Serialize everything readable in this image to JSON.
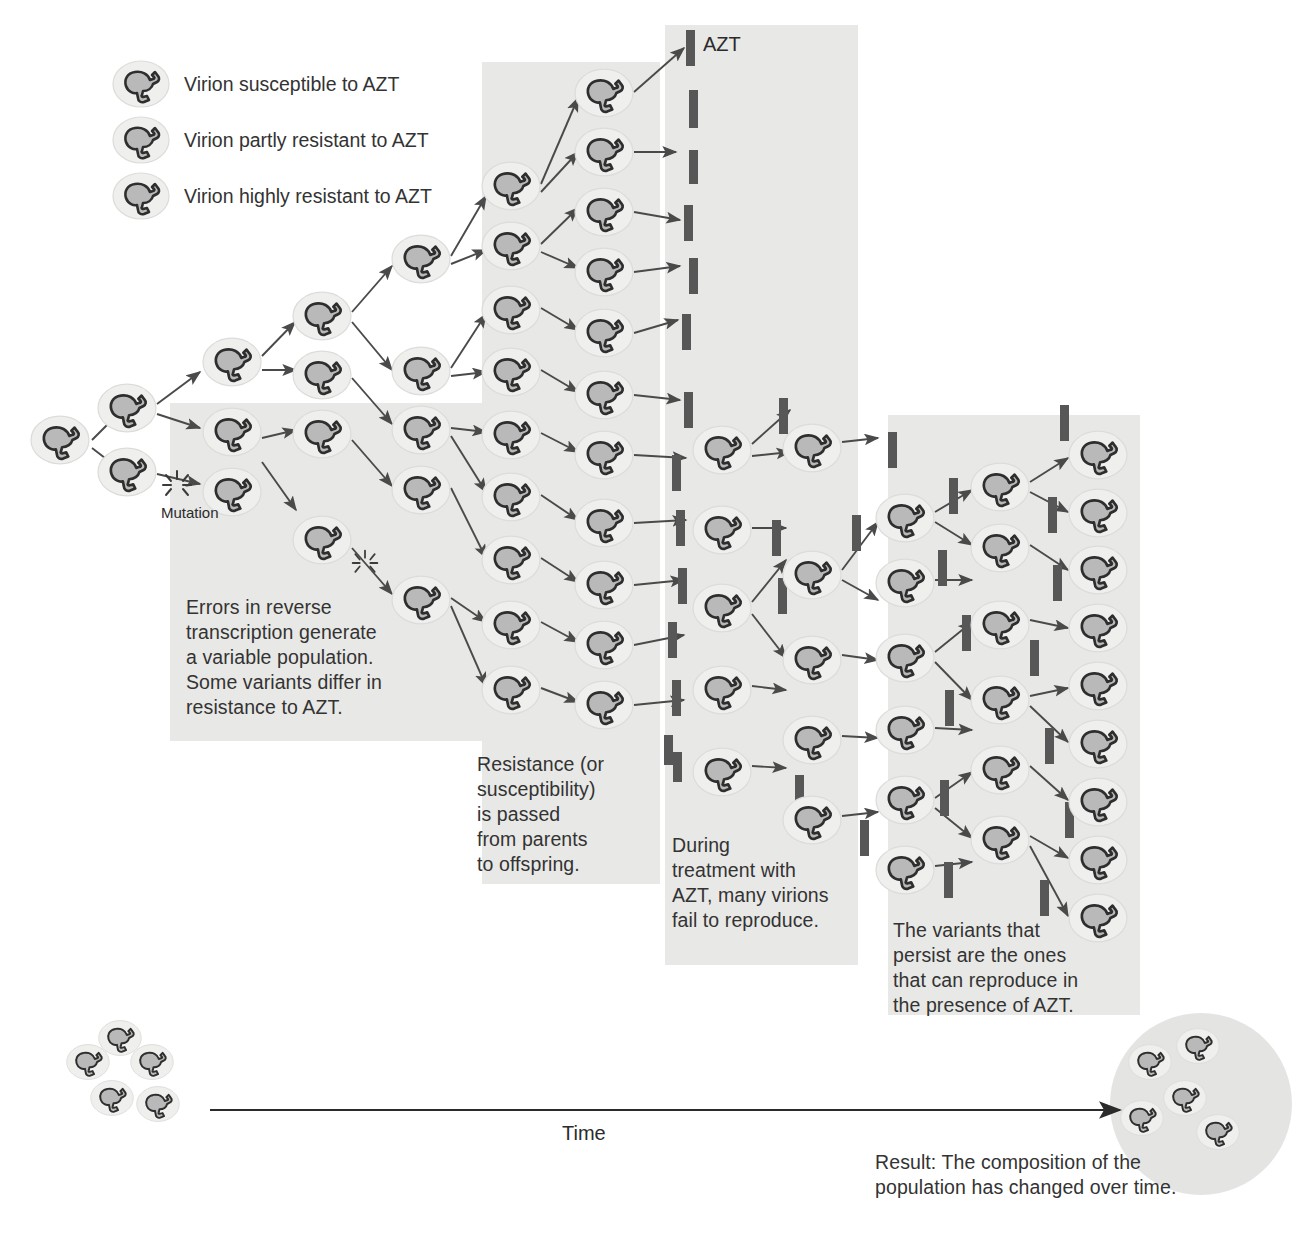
{
  "figure": {
    "type": "diagram"
  },
  "legend": {
    "items": [
      {
        "icon": "virion-icon",
        "label": "Virion susceptible to AZT",
        "fill": "#b3b3b3"
      },
      {
        "icon": "virion-icon",
        "label": "Virion partly resistant to AZT",
        "fill": "#bdbdbd"
      },
      {
        "icon": "virion-icon",
        "label": "Virion highly resistant to AZT",
        "fill": "#c7c7c7"
      }
    ]
  },
  "labels": {
    "mutation": "Mutation",
    "azt": "AZT",
    "time": "Time"
  },
  "captions": [
    {
      "id": "caption-variation",
      "text": "Errors in reverse\ntranscription generate\na variable population.\nSome variants differ in\nresistance to AZT."
    },
    {
      "id": "caption-heredity",
      "text": "Resistance (or\nsusceptibility)\nis passed\nfrom parents\nto offspring."
    },
    {
      "id": "caption-selection",
      "text": "During\ntreatment with\nAZT, many virions\nfail to reproduce."
    },
    {
      "id": "caption-persistence",
      "text": "The variants that\npersist are the ones\nthat can reproduce in\nthe presence of AZT."
    }
  ],
  "result": {
    "text": "Result: The composition of the\npopulation has changed over time."
  },
  "colors": {
    "panel_shade": "#e8e8e6",
    "virion_body": "#b9b9b9",
    "virion_outline": "#2e2e2e",
    "virion_halo": "#efefed",
    "azt_bar": "#575757",
    "arrow": "#4a4a4a",
    "text": "#333333",
    "end_circle": "#e4e4e2"
  },
  "chart_data": {
    "type": "diagram",
    "stages": [
      {
        "name": "origin",
        "virion_count": 1
      },
      {
        "name": "first-division",
        "virion_count": 2
      },
      {
        "name": "variation-panel",
        "virion_count": 8
      },
      {
        "name": "heredity-panel",
        "virion_count": 14
      },
      {
        "name": "selection-panel",
        "virion_count": 10
      },
      {
        "name": "persistence-panel",
        "virion_count": 18
      }
    ],
    "azt_bar_count": 40,
    "start_population": 5,
    "end_population": 5
  },
  "virions": [
    {
      "x": 60,
      "y": 440,
      "r": 30
    },
    {
      "x": 127,
      "y": 408,
      "r": 30
    },
    {
      "x": 127,
      "y": 472,
      "r": 30
    },
    {
      "x": 232,
      "y": 362,
      "r": 30
    },
    {
      "x": 232,
      "y": 432,
      "r": 30
    },
    {
      "x": 232,
      "y": 492,
      "r": 30
    },
    {
      "x": 322,
      "y": 316,
      "r": 30
    },
    {
      "x": 322,
      "y": 375,
      "r": 30
    },
    {
      "x": 322,
      "y": 434,
      "r": 30
    },
    {
      "x": 322,
      "y": 540,
      "r": 30
    },
    {
      "x": 421,
      "y": 259,
      "r": 30
    },
    {
      "x": 421,
      "y": 371,
      "r": 30
    },
    {
      "x": 421,
      "y": 430,
      "r": 30
    },
    {
      "x": 421,
      "y": 490,
      "r": 30
    },
    {
      "x": 421,
      "y": 600,
      "r": 30
    },
    {
      "x": 511,
      "y": 186,
      "r": 30
    },
    {
      "x": 511,
      "y": 246,
      "r": 30
    },
    {
      "x": 511,
      "y": 310,
      "r": 30
    },
    {
      "x": 511,
      "y": 372,
      "r": 30
    },
    {
      "x": 511,
      "y": 435,
      "r": 30
    },
    {
      "x": 511,
      "y": 497,
      "r": 30
    },
    {
      "x": 511,
      "y": 560,
      "r": 30
    },
    {
      "x": 511,
      "y": 625,
      "r": 30
    },
    {
      "x": 511,
      "y": 690,
      "r": 30
    },
    {
      "x": 604,
      "y": 93,
      "r": 30
    },
    {
      "x": 604,
      "y": 152,
      "r": 30
    },
    {
      "x": 604,
      "y": 212,
      "r": 30
    },
    {
      "x": 604,
      "y": 272,
      "r": 30
    },
    {
      "x": 604,
      "y": 333,
      "r": 30
    },
    {
      "x": 604,
      "y": 395,
      "r": 30
    },
    {
      "x": 604,
      "y": 455,
      "r": 30
    },
    {
      "x": 604,
      "y": 523,
      "r": 30
    },
    {
      "x": 604,
      "y": 585,
      "r": 30
    },
    {
      "x": 604,
      "y": 645,
      "r": 30
    },
    {
      "x": 604,
      "y": 705,
      "r": 30
    },
    {
      "x": 722,
      "y": 450,
      "r": 30
    },
    {
      "x": 722,
      "y": 530,
      "r": 30
    },
    {
      "x": 722,
      "y": 608,
      "r": 30
    },
    {
      "x": 722,
      "y": 690,
      "r": 30
    },
    {
      "x": 722,
      "y": 772,
      "r": 30
    },
    {
      "x": 812,
      "y": 448,
      "r": 30
    },
    {
      "x": 812,
      "y": 575,
      "r": 30
    },
    {
      "x": 812,
      "y": 660,
      "r": 30
    },
    {
      "x": 812,
      "y": 740,
      "r": 30
    },
    {
      "x": 812,
      "y": 820,
      "r": 30
    },
    {
      "x": 905,
      "y": 518,
      "r": 30
    },
    {
      "x": 905,
      "y": 583,
      "r": 30
    },
    {
      "x": 905,
      "y": 658,
      "r": 30
    },
    {
      "x": 905,
      "y": 730,
      "r": 30
    },
    {
      "x": 905,
      "y": 800,
      "r": 30
    },
    {
      "x": 905,
      "y": 870,
      "r": 30
    },
    {
      "x": 1000,
      "y": 487,
      "r": 30
    },
    {
      "x": 1000,
      "y": 548,
      "r": 30
    },
    {
      "x": 1000,
      "y": 625,
      "r": 30
    },
    {
      "x": 1000,
      "y": 700,
      "r": 30
    },
    {
      "x": 1000,
      "y": 770,
      "r": 30
    },
    {
      "x": 1000,
      "y": 840,
      "r": 30
    },
    {
      "x": 1098,
      "y": 455,
      "r": 30
    },
    {
      "x": 1098,
      "y": 513,
      "r": 30
    },
    {
      "x": 1098,
      "y": 570,
      "r": 30
    },
    {
      "x": 1098,
      "y": 628,
      "r": 30
    },
    {
      "x": 1098,
      "y": 686,
      "r": 30
    },
    {
      "x": 1098,
      "y": 744,
      "r": 30
    },
    {
      "x": 1098,
      "y": 802,
      "r": 30
    },
    {
      "x": 1098,
      "y": 860,
      "r": 30
    },
    {
      "x": 1098,
      "y": 918,
      "r": 30
    }
  ],
  "start_cluster": [
    {
      "x": 88,
      "y": 1062,
      "r": 22
    },
    {
      "x": 120,
      "y": 1038,
      "r": 22
    },
    {
      "x": 152,
      "y": 1062,
      "r": 22
    },
    {
      "x": 112,
      "y": 1098,
      "r": 22
    },
    {
      "x": 158,
      "y": 1104,
      "r": 22
    }
  ],
  "end_cluster": [
    {
      "x": 1150,
      "y": 1062,
      "r": 22
    },
    {
      "x": 1198,
      "y": 1046,
      "r": 22
    },
    {
      "x": 1185,
      "y": 1098,
      "r": 22
    },
    {
      "x": 1142,
      "y": 1118,
      "r": 22
    },
    {
      "x": 1218,
      "y": 1132,
      "r": 22
    }
  ],
  "azt_bars": [
    {
      "x": 686,
      "y": 30,
      "w": 9,
      "h": 36
    },
    {
      "x": 689,
      "y": 90,
      "w": 9,
      "h": 38
    },
    {
      "x": 689,
      "y": 150,
      "w": 9,
      "h": 34
    },
    {
      "x": 684,
      "y": 205,
      "w": 9,
      "h": 36
    },
    {
      "x": 689,
      "y": 258,
      "w": 9,
      "h": 36
    },
    {
      "x": 682,
      "y": 314,
      "w": 9,
      "h": 36
    },
    {
      "x": 684,
      "y": 392,
      "w": 9,
      "h": 36
    },
    {
      "x": 672,
      "y": 455,
      "w": 9,
      "h": 36
    },
    {
      "x": 676,
      "y": 510,
      "w": 9,
      "h": 36
    },
    {
      "x": 678,
      "y": 568,
      "w": 9,
      "h": 36
    },
    {
      "x": 668,
      "y": 622,
      "w": 9,
      "h": 36
    },
    {
      "x": 672,
      "y": 680,
      "w": 9,
      "h": 36
    },
    {
      "x": 664,
      "y": 735,
      "w": 9,
      "h": 30
    },
    {
      "x": 673,
      "y": 752,
      "w": 9,
      "h": 30
    },
    {
      "x": 779,
      "y": 398,
      "w": 9,
      "h": 36
    },
    {
      "x": 772,
      "y": 520,
      "w": 9,
      "h": 36
    },
    {
      "x": 852,
      "y": 515,
      "w": 9,
      "h": 36
    },
    {
      "x": 778,
      "y": 578,
      "w": 9,
      "h": 36
    },
    {
      "x": 795,
      "y": 775,
      "w": 9,
      "h": 36
    },
    {
      "x": 860,
      "y": 820,
      "w": 9,
      "h": 36
    },
    {
      "x": 888,
      "y": 432,
      "w": 9,
      "h": 36
    },
    {
      "x": 949,
      "y": 478,
      "w": 9,
      "h": 36
    },
    {
      "x": 938,
      "y": 550,
      "w": 9,
      "h": 36
    },
    {
      "x": 962,
      "y": 615,
      "w": 9,
      "h": 36
    },
    {
      "x": 945,
      "y": 690,
      "w": 9,
      "h": 36
    },
    {
      "x": 940,
      "y": 780,
      "w": 9,
      "h": 36
    },
    {
      "x": 944,
      "y": 862,
      "w": 9,
      "h": 36
    },
    {
      "x": 1060,
      "y": 405,
      "w": 9,
      "h": 36
    },
    {
      "x": 1048,
      "y": 497,
      "w": 9,
      "h": 36
    },
    {
      "x": 1053,
      "y": 565,
      "w": 9,
      "h": 36
    },
    {
      "x": 1030,
      "y": 640,
      "w": 9,
      "h": 36
    },
    {
      "x": 1045,
      "y": 728,
      "w": 9,
      "h": 36
    },
    {
      "x": 1065,
      "y": 802,
      "w": 9,
      "h": 36
    },
    {
      "x": 1040,
      "y": 880,
      "w": 9,
      "h": 36
    }
  ],
  "panels": [
    {
      "id": "panel-variation",
      "x": 170,
      "y": 403,
      "w": 348,
      "h": 338
    },
    {
      "id": "panel-heredity",
      "x": 482,
      "y": 62,
      "w": 178,
      "h": 822
    },
    {
      "id": "panel-selection",
      "x": 665,
      "y": 25,
      "w": 193,
      "h": 940
    },
    {
      "id": "panel-persistence",
      "x": 888,
      "y": 415,
      "w": 182,
      "h": 600
    },
    {
      "id": "panel-final-col",
      "x": 1068,
      "y": 415,
      "w": 72,
      "h": 600
    }
  ],
  "arrows": [
    [
      92,
      440,
      118,
      414
    ],
    [
      92,
      448,
      118,
      468
    ],
    [
      157,
      404,
      200,
      372
    ],
    [
      157,
      414,
      200,
      428
    ],
    [
      157,
      474,
      200,
      484
    ],
    [
      262,
      356,
      295,
      322
    ],
    [
      262,
      370,
      296,
      370
    ],
    [
      262,
      438,
      296,
      430
    ],
    [
      262,
      462,
      296,
      510
    ],
    [
      352,
      312,
      392,
      266
    ],
    [
      352,
      322,
      392,
      370
    ],
    [
      352,
      378,
      392,
      424
    ],
    [
      352,
      440,
      392,
      486
    ],
    [
      352,
      548,
      392,
      594
    ],
    [
      451,
      256,
      486,
      196
    ],
    [
      451,
      264,
      486,
      250
    ],
    [
      451,
      368,
      486,
      314
    ],
    [
      451,
      376,
      486,
      372
    ],
    [
      451,
      428,
      486,
      432
    ],
    [
      451,
      436,
      486,
      492
    ],
    [
      451,
      488,
      486,
      558
    ],
    [
      451,
      598,
      486,
      622
    ],
    [
      451,
      606,
      486,
      686
    ],
    [
      541,
      184,
      578,
      98
    ],
    [
      541,
      192,
      578,
      152
    ],
    [
      541,
      244,
      578,
      208
    ],
    [
      541,
      252,
      578,
      268
    ],
    [
      541,
      308,
      578,
      330
    ],
    [
      541,
      370,
      578,
      392
    ],
    [
      541,
      433,
      578,
      452
    ],
    [
      541,
      495,
      578,
      520
    ],
    [
      541,
      558,
      578,
      582
    ],
    [
      541,
      622,
      578,
      642
    ],
    [
      541,
      688,
      578,
      702
    ],
    [
      634,
      92,
      684,
      48
    ],
    [
      634,
      152,
      676,
      152
    ],
    [
      634,
      212,
      680,
      220
    ],
    [
      634,
      272,
      680,
      266
    ],
    [
      634,
      333,
      678,
      320
    ],
    [
      634,
      395,
      680,
      400
    ],
    [
      634,
      455,
      686,
      458
    ],
    [
      634,
      523,
      686,
      520
    ],
    [
      634,
      585,
      684,
      580
    ],
    [
      634,
      645,
      684,
      635
    ],
    [
      634,
      705,
      684,
      700
    ],
    [
      752,
      444,
      790,
      410
    ],
    [
      752,
      456,
      790,
      452
    ],
    [
      752,
      528,
      786,
      528
    ],
    [
      752,
      602,
      786,
      560
    ],
    [
      752,
      614,
      786,
      658
    ],
    [
      752,
      686,
      786,
      690
    ],
    [
      752,
      766,
      786,
      768
    ],
    [
      842,
      442,
      878,
      438
    ],
    [
      842,
      570,
      878,
      522
    ],
    [
      842,
      580,
      878,
      600
    ],
    [
      842,
      655,
      878,
      660
    ],
    [
      842,
      736,
      878,
      738
    ],
    [
      842,
      816,
      878,
      812
    ],
    [
      935,
      512,
      972,
      490
    ],
    [
      935,
      522,
      972,
      545
    ],
    [
      935,
      580,
      972,
      580
    ],
    [
      935,
      652,
      972,
      622
    ],
    [
      935,
      662,
      972,
      700
    ],
    [
      935,
      728,
      972,
      730
    ],
    [
      935,
      798,
      972,
      772
    ],
    [
      935,
      808,
      972,
      838
    ],
    [
      935,
      866,
      972,
      862
    ],
    [
      1030,
      482,
      1068,
      458
    ],
    [
      1030,
      492,
      1068,
      512
    ],
    [
      1030,
      545,
      1068,
      570
    ],
    [
      1030,
      620,
      1068,
      628
    ],
    [
      1030,
      696,
      1068,
      688
    ],
    [
      1030,
      706,
      1068,
      742
    ],
    [
      1030,
      766,
      1068,
      800
    ],
    [
      1030,
      836,
      1068,
      858
    ],
    [
      1030,
      846,
      1068,
      916
    ]
  ]
}
